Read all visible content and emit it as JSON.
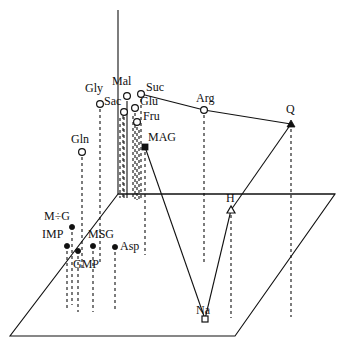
{
  "figure": {
    "type": "3d-scatter",
    "title": "",
    "background": "#ffffff",
    "ink": "#111111"
  },
  "axes": {
    "vertical_axis": {
      "name": "vertical-axis",
      "x": 118,
      "y_top": 10,
      "y_bottom": 194
    },
    "base_plane": {
      "name": "base-plane-parallelogram",
      "corners": [
        [
          118,
          194
        ],
        [
          335,
          194
        ],
        [
          235,
          336
        ],
        [
          10,
          336
        ]
      ]
    },
    "back_edge": {
      "name": "base-plane-back-edge",
      "from": [
        118,
        194
      ],
      "to": [
        335,
        194
      ]
    }
  },
  "chart_data": {
    "type": "scatter",
    "title": "",
    "xlabel": "",
    "ylabel": "",
    "zlabel": "",
    "grid": false,
    "legend": "none",
    "projection": "3d-parallelogram-base",
    "note": "Points are plotted in a 3D box; each point has a dashed drop-line to the base plane. Solid segments join Suc-Arg-Q and Q-H-Na-MAG.",
    "marker_styles": {
      "open-circle": "hollow circle",
      "filled-circle": "solid dot",
      "open-triangle": "hollow triangle",
      "filled-triangle": "solid triangle",
      "open-square": "hollow square",
      "filled-square": "solid square"
    },
    "points": [
      {
        "id": "gly",
        "label": "Gly",
        "marker": "open-circle",
        "px": 100,
        "py": 104,
        "drop_to_y": 262,
        "label_x": 85,
        "label_y": 82
      },
      {
        "id": "mal",
        "label": "Mal",
        "marker": "open-circle",
        "px": 127,
        "py": 96,
        "drop_to_y": 198,
        "label_x": 112,
        "label_y": 75
      },
      {
        "id": "suc",
        "label": "Suc",
        "marker": "open-circle",
        "px": 141,
        "py": 94,
        "drop_to_y": 198,
        "label_x": 146,
        "label_y": 81
      },
      {
        "id": "sac",
        "label": "Sac",
        "marker": "open-circle",
        "px": 124,
        "py": 112,
        "drop_to_y": 198,
        "label_x": 104,
        "label_y": 95
      },
      {
        "id": "glu",
        "label": "Glu",
        "marker": "open-circle",
        "px": 135,
        "py": 108,
        "drop_to_y": 199,
        "label_x": 140,
        "label_y": 95
      },
      {
        "id": "fru",
        "label": "Fru",
        "marker": "open-circle",
        "px": 137,
        "py": 122,
        "drop_to_y": 200,
        "label_x": 143,
        "label_y": 110
      },
      {
        "id": "gln",
        "label": "Gln",
        "marker": "open-circle",
        "px": 82,
        "py": 152,
        "drop_to_y": 270,
        "label_x": 71,
        "label_y": 133
      },
      {
        "id": "mag",
        "label": "MAG",
        "marker": "filled-square",
        "px": 145,
        "py": 147,
        "drop_to_y": 255,
        "label_x": 148,
        "label_y": 131
      },
      {
        "id": "arg",
        "label": "Arg",
        "marker": "open-circle",
        "px": 204,
        "py": 110,
        "drop_to_y": 263,
        "label_x": 196,
        "label_y": 92
      },
      {
        "id": "q",
        "label": "Q",
        "marker": "filled-triangle",
        "px": 291,
        "py": 124,
        "drop_to_y": 317,
        "label_x": 286,
        "label_y": 103
      },
      {
        "id": "h",
        "label": "H",
        "marker": "open-triangle",
        "px": 231,
        "py": 210,
        "drop_to_y": 318,
        "label_x": 226,
        "label_y": 192
      },
      {
        "id": "na",
        "label": "Na",
        "marker": "open-square",
        "px": 205,
        "py": 319,
        "drop_to_y": 319,
        "label_x": 196,
        "label_y": 304
      },
      {
        "id": "mg",
        "label": "M÷G",
        "marker": "filled-circle",
        "px": 72,
        "py": 227,
        "drop_to_y": 305,
        "label_x": 44,
        "label_y": 210
      },
      {
        "id": "imp",
        "label": "IMP",
        "marker": "filled-circle",
        "px": 67,
        "py": 246,
        "drop_to_y": 310,
        "label_x": 42,
        "label_y": 228
      },
      {
        "id": "gmp",
        "label": "GMP",
        "marker": "filled-circle",
        "px": 78,
        "py": 251,
        "drop_to_y": 312,
        "label_x": 73,
        "label_y": 258
      },
      {
        "id": "msg",
        "label": "MSG",
        "marker": "filled-circle",
        "px": 93,
        "py": 246,
        "drop_to_y": 312,
        "label_x": 88,
        "label_y": 228
      },
      {
        "id": "asp",
        "label": "Asp",
        "marker": "filled-circle",
        "px": 115,
        "py": 247,
        "drop_to_y": 310,
        "label_x": 120,
        "label_y": 240
      }
    ],
    "connections": [
      {
        "name": "suc-arg",
        "from": "suc",
        "to": "arg"
      },
      {
        "name": "arg-q",
        "from": "arg",
        "to": "q"
      },
      {
        "name": "q-h",
        "from": "q",
        "to": "h"
      },
      {
        "name": "h-na",
        "from": "h",
        "to": "na"
      },
      {
        "name": "na-mag",
        "from": "na",
        "to": "mag"
      }
    ],
    "extra_droplines": [
      {
        "name": "mal-stub-a",
        "x": 123,
        "y_top": 110,
        "y_bottom": 198
      },
      {
        "name": "mal-stub-b",
        "x": 127,
        "y_top": 104,
        "y_bottom": 198
      },
      {
        "name": "sac-stub",
        "x": 120,
        "y_top": 118,
        "y_bottom": 198
      },
      {
        "name": "glu-stub",
        "x": 133,
        "y_top": 116,
        "y_bottom": 199
      },
      {
        "name": "fru-stub",
        "x": 139,
        "y_top": 130,
        "y_bottom": 200
      }
    ]
  }
}
